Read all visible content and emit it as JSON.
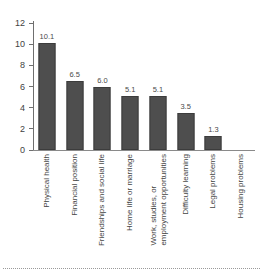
{
  "chart_data": {
    "type": "bar",
    "title": "",
    "subtitle": "",
    "xlabel": "",
    "ylabel": "",
    "ylim": [
      0,
      12
    ],
    "ytick_step": 2,
    "grid": false,
    "legend": false,
    "legend_position": "none",
    "orientation": "vertical",
    "value_labels": true,
    "xtick_label_rotation": 90,
    "bar_color": "#4e4e4e",
    "axis_color": "#6f6f6f",
    "text_color": "#3f3f3f",
    "yticks": [
      "0",
      "2",
      "4",
      "6",
      "8",
      "10",
      "12"
    ],
    "categories": [
      "Physical health",
      "Financial position",
      "Friendships and social life",
      "Home life or marriage",
      "Work, studies, or employment opportunities",
      "Difficulty learning",
      "Legal problems",
      "Housing problems"
    ],
    "values": [
      10.1,
      6.5,
      6.0,
      5.1,
      5.1,
      3.5,
      1.3,
      0
    ],
    "data_labels": [
      "10.1",
      "6.5",
      "6.0",
      "5.1",
      "5.1",
      "3.5",
      "1.3",
      ""
    ],
    "points": [
      {
        "category": "Physical health",
        "value": 10.1,
        "label": "10.1",
        "label_line1": "Physical health",
        "label_line2": ""
      },
      {
        "category": "Financial position",
        "value": 6.5,
        "label": "6.5",
        "label_line1": "Financial position",
        "label_line2": ""
      },
      {
        "category": "Friendships and social life",
        "value": 6.0,
        "label": "6.0",
        "label_line1": "Friendships and social life",
        "label_line2": ""
      },
      {
        "category": "Home life or marriage",
        "value": 5.1,
        "label": "5.1",
        "label_line1": "Home life or marriage",
        "label_line2": ""
      },
      {
        "category": "Work, studies, or employment opportunities",
        "value": 5.1,
        "label": "5.1",
        "label_line1": "Work, studies, or",
        "label_line2": "employment opportunities"
      },
      {
        "category": "Difficulty learning",
        "value": 3.5,
        "label": "3.5",
        "label_line1": "Difficulty learning",
        "label_line2": ""
      },
      {
        "category": "Legal problems",
        "value": 1.3,
        "label": "1.3",
        "label_line1": "Legal problems",
        "label_line2": ""
      },
      {
        "category": "Housing problems",
        "value": 0,
        "label": "",
        "label_line1": "Housing problems",
        "label_line2": ""
      }
    ]
  }
}
